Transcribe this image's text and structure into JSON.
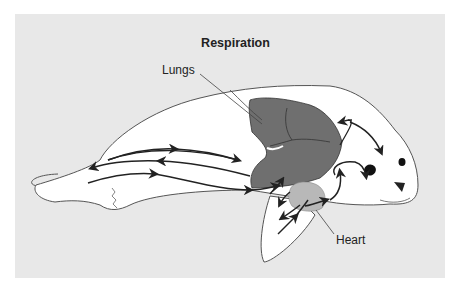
{
  "diagram": {
    "title": "Respiration",
    "labels": {
      "lungs": "Lungs",
      "heart": "Heart"
    },
    "colors": {
      "background_panel": "#e8e8e8",
      "body_fill": "#ffffff",
      "lungs_fill": "#6f6f6f",
      "heart_fill": "#b8b8b8",
      "outline": "#444444",
      "arrow": "#222222"
    }
  }
}
